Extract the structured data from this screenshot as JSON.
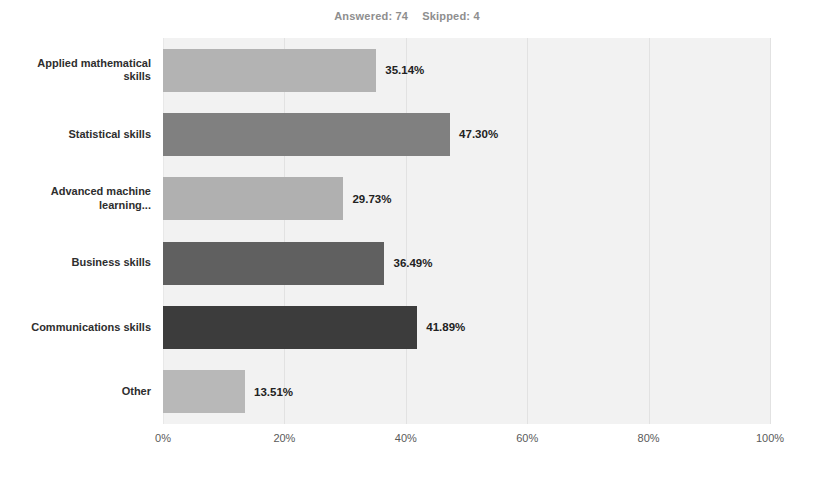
{
  "header": {
    "answered_label": "Answered: 74",
    "skipped_label": "Skipped: 4"
  },
  "axis": {
    "ticks": [
      "0%",
      "20%",
      "40%",
      "60%",
      "80%",
      "100%"
    ]
  },
  "colors": {
    "plot_background": "#f2f2f2",
    "gridline": "#e2e2e2",
    "header_text": "#8e8e8e",
    "label_text": "#2e2e2e",
    "value_text": "#222222",
    "tick_text": "#5a5a5a"
  },
  "chart_data": {
    "type": "bar",
    "orientation": "horizontal",
    "title": "",
    "subtitle": "Answered: 74   Skipped: 4",
    "xlabel": "",
    "ylabel": "",
    "xlim": [
      0,
      100
    ],
    "xticks": [
      0,
      20,
      40,
      60,
      80,
      100
    ],
    "xtick_labels": [
      "0%",
      "20%",
      "40%",
      "60%",
      "80%",
      "100%"
    ],
    "grid": true,
    "legend": "none",
    "value_suffix": "%",
    "categories": [
      "Applied mathematical skills",
      "Statistical skills",
      "Advanced machine learning...",
      "Business skills",
      "Communications skills",
      "Other"
    ],
    "values": [
      35.14,
      47.3,
      29.73,
      36.49,
      41.89,
      13.51
    ],
    "value_labels": [
      "35.14%",
      "47.30%",
      "29.73%",
      "36.49%",
      "41.89%",
      "13.51%"
    ],
    "bar_colors": [
      "#b3b3b3",
      "#808080",
      "#b0b0b0",
      "#606060",
      "#3c3c3c",
      "#b8b8b8"
    ]
  }
}
